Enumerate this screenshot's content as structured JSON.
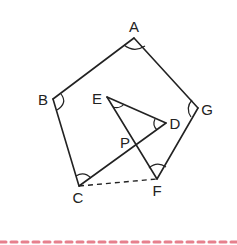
{
  "diagram": {
    "title": "",
    "points": [
      {
        "name": "A",
        "x": 134,
        "y": 38,
        "label_x": 134,
        "label_y": 32
      },
      {
        "name": "B",
        "x": 53,
        "y": 99,
        "label_x": 43,
        "label_y": 105
      },
      {
        "name": "C",
        "x": 79,
        "y": 186,
        "label_x": 78,
        "label_y": 203
      },
      {
        "name": "F",
        "x": 157,
        "y": 179,
        "label_x": 157,
        "label_y": 196
      },
      {
        "name": "G",
        "x": 198,
        "y": 108,
        "label_x": 207,
        "label_y": 115
      },
      {
        "name": "E",
        "x": 107,
        "y": 97,
        "label_x": 97,
        "label_y": 104
      },
      {
        "name": "D",
        "x": 166,
        "y": 123,
        "label_x": 175,
        "label_y": 129
      },
      {
        "name": "P",
        "x": 137,
        "y": 145,
        "label_x": 125,
        "label_y": 148
      }
    ],
    "segments": [
      {
        "from": "A",
        "to": "B",
        "style": "solid"
      },
      {
        "from": "B",
        "to": "C",
        "style": "solid"
      },
      {
        "from": "A",
        "to": "G",
        "style": "solid"
      },
      {
        "from": "G",
        "to": "F",
        "style": "solid"
      },
      {
        "from": "C",
        "to": "D",
        "style": "solid"
      },
      {
        "from": "E",
        "to": "D",
        "style": "solid"
      },
      {
        "from": "E",
        "to": "F",
        "style": "solid"
      },
      {
        "from": "C",
        "to": "F",
        "style": "dashed"
      }
    ],
    "angle_marks": [
      "A",
      "B",
      "C",
      "E",
      "D",
      "F",
      "G"
    ],
    "border_color": "#e06070"
  }
}
